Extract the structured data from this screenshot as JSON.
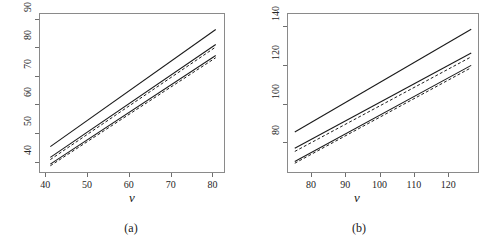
{
  "figure": {
    "background": "#ffffff",
    "frame_color": "#8a8a8a",
    "line_color": "#1a1a1a"
  },
  "chart_data": [
    {
      "id": "panel-a",
      "type": "line",
      "title": "",
      "caption": "(a)",
      "xlabel": "v",
      "ylabel": "",
      "xlim": [
        38.5,
        83.0
      ],
      "ylim": [
        36.0,
        92.0
      ],
      "xticks": [
        40,
        50,
        60,
        70,
        80
      ],
      "yticks": [
        40,
        50,
        60,
        70,
        80,
        90
      ],
      "xticklabels": [
        "40",
        "50",
        "60",
        "70",
        "80"
      ],
      "yticklabels": [
        "40",
        "50",
        "60",
        "70",
        "80",
        "90"
      ],
      "grid": false,
      "legend": "none",
      "x": [
        41,
        81
      ],
      "series": [
        {
          "name": "upper-solid",
          "style": "solid",
          "values": [
            45.0,
            86.5
          ]
        },
        {
          "name": "middle-solid",
          "style": "solid",
          "values": [
            41.2,
            81.2
          ]
        },
        {
          "name": "middle-dashed",
          "style": "dashed",
          "values": [
            40.4,
            80.3
          ]
        },
        {
          "name": "lower-solid",
          "style": "solid",
          "values": [
            38.8,
            77.3
          ]
        },
        {
          "name": "lower-dashed",
          "style": "dashed",
          "values": [
            38.2,
            76.5
          ]
        }
      ]
    },
    {
      "id": "panel-b",
      "type": "line",
      "title": "",
      "caption": "(b)",
      "xlabel": "v",
      "ylabel": "",
      "xlim": [
        73.0,
        129.0
      ],
      "ylim": [
        64.0,
        147.0
      ],
      "xticks": [
        80,
        90,
        100,
        110,
        120
      ],
      "yticks": [
        80,
        100,
        120,
        140
      ],
      "xticklabels": [
        "80",
        "90",
        "100",
        "110",
        "120"
      ],
      "yticklabels": [
        "80",
        "100",
        "120",
        "140"
      ],
      "grid": false,
      "legend": "none",
      "x": [
        75,
        127
      ],
      "series": [
        {
          "name": "upper-solid",
          "style": "solid",
          "values": [
            85.0,
            139.0
          ]
        },
        {
          "name": "middle-solid",
          "style": "solid",
          "values": [
            76.5,
            126.5
          ]
        },
        {
          "name": "middle-dashed",
          "style": "dashed",
          "values": [
            74.8,
            124.5
          ]
        },
        {
          "name": "lower-solid",
          "style": "solid",
          "values": [
            69.5,
            120.0
          ]
        },
        {
          "name": "lower-dashed",
          "style": "dashed",
          "values": [
            68.6,
            118.8
          ]
        }
      ]
    }
  ]
}
